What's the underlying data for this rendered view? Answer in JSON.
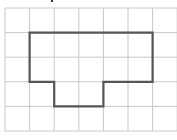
{
  "figure": {
    "type": "grid-polygon",
    "grid": {
      "columns": 7,
      "rows": 5,
      "cell_size_px": 24.6,
      "origin_px": [
        5,
        8
      ],
      "line_color": "#c8c8c8"
    },
    "polygon": {
      "stroke_color": "#555555",
      "stroke_width": 2.2,
      "vertices_cells": [
        [
          1,
          1
        ],
        [
          6,
          1
        ],
        [
          6,
          3
        ],
        [
          4,
          3
        ],
        [
          4,
          4
        ],
        [
          2,
          4
        ],
        [
          2,
          3
        ],
        [
          1,
          3
        ]
      ]
    },
    "top_mark": {
      "x_px": 51,
      "color": "#333333"
    }
  }
}
